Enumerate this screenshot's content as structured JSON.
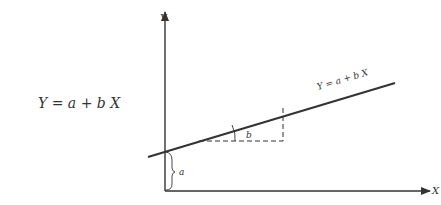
{
  "equation": "Y = a + b X",
  "axes": {
    "y_label": "Y",
    "x_label": "X"
  },
  "line_label": "Y = a + b X",
  "intercept_label": "a",
  "slope_label": "b",
  "colors": {
    "ink": "#333333",
    "background": "#ffffff"
  }
}
